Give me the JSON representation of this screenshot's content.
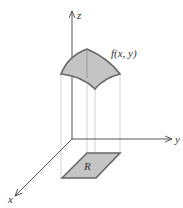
{
  "diagram": {
    "axes": {
      "z_label": "z",
      "y_label": "y",
      "x_label": "x"
    },
    "surface_label": "f(x, y)",
    "region_label": "R",
    "colors": {
      "fill": "#c8c8c8",
      "edge": "#666666",
      "axis": "#444444",
      "projection": "#bbbbbb"
    }
  }
}
